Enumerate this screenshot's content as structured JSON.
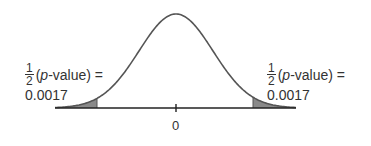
{
  "chart_data": {
    "type": "area",
    "title": "",
    "x_center": 0,
    "xlabel": "",
    "ylabel": "",
    "tick_labels": [
      "0"
    ],
    "curve": "normal",
    "shaded_regions": [
      {
        "side": "left",
        "area": 0.0017,
        "label": "1/2 (p-value) = 0.0017"
      },
      {
        "side": "right",
        "area": 0.0017,
        "label": "1/2 (p-value) = 0.0017"
      }
    ],
    "colors": {
      "curve": "#555555",
      "shade": "#8a8a8a",
      "axis": "#222222"
    }
  },
  "labels": {
    "left": {
      "frac_num": "1",
      "frac_den": "2",
      "p_open": "(",
      "p_italic": "p",
      "p_rest": "-value) =",
      "value": "0.0017"
    },
    "right": {
      "frac_num": "1",
      "frac_den": "2",
      "p_open": "(",
      "p_italic": "p",
      "p_rest": "-value) =",
      "value": "0.0017"
    },
    "tick": "0"
  }
}
